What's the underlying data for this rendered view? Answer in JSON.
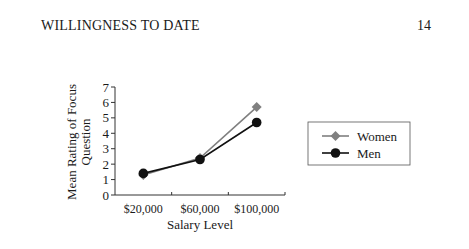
{
  "page": {
    "running_head": "WILLINGNESS TO DATE",
    "page_number": "14"
  },
  "chart_data": {
    "type": "line",
    "title": "",
    "xlabel": "Salary Level",
    "ylabel_line1": "Mean Rating of Focus",
    "ylabel_line2": "Question",
    "categories": [
      "$20,000",
      "$60,000",
      "$100,000"
    ],
    "yticks": [
      "0",
      "1",
      "2",
      "3",
      "4",
      "5",
      "6",
      "7"
    ],
    "ylim": [
      0,
      7
    ],
    "grid": false,
    "legend_position": "right",
    "series": [
      {
        "name": "Women",
        "marker": "diamond",
        "color": "#808080",
        "values": [
          1.3,
          2.4,
          5.7
        ]
      },
      {
        "name": "Men",
        "marker": "circle",
        "color": "#111111",
        "values": [
          1.4,
          2.3,
          4.7
        ]
      }
    ]
  }
}
